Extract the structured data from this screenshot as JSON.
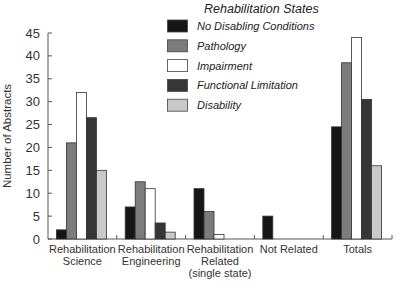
{
  "chart_data": {
    "type": "bar",
    "title": "",
    "xlabel": "",
    "ylabel": "Number of Abstracts",
    "ylim": [
      0,
      45
    ],
    "yticks": [
      0,
      5,
      10,
      15,
      20,
      25,
      30,
      35,
      40,
      45
    ],
    "grid": false,
    "legend_title": "Rehabilitation States",
    "legend_position": "top-center",
    "categories": [
      [
        "Rehabilitation",
        "Science"
      ],
      [
        "Rehabilitation",
        "Engineering"
      ],
      [
        "Rehabilitation",
        "Related",
        "(single state)"
      ],
      [
        "Not Related"
      ],
      [
        "Totals"
      ]
    ],
    "series": [
      {
        "name": "No Disabling Conditions",
        "color": "#161616",
        "values": [
          2,
          7,
          11,
          5,
          24.5
        ]
      },
      {
        "name": "Pathology",
        "color": "#7c7c7c",
        "values": [
          21,
          12.5,
          6,
          0,
          38.5
        ]
      },
      {
        "name": "Impairment",
        "color": "#ffffff",
        "values": [
          32,
          11,
          1,
          0,
          44
        ]
      },
      {
        "name": "Functional Limitation",
        "color": "#363636",
        "values": [
          26.5,
          3.5,
          0,
          0,
          30.5
        ]
      },
      {
        "name": "Disability",
        "color": "#c9c9c9",
        "values": [
          15,
          1.5,
          0,
          0,
          16
        ]
      }
    ]
  }
}
